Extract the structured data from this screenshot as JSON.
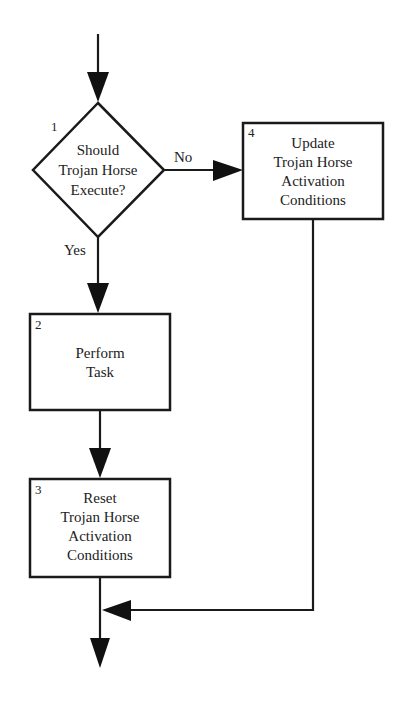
{
  "diagram": {
    "type": "flowchart",
    "colors": {
      "stroke": "#1a1a1a",
      "text": "#222222",
      "background": "#ffffff"
    },
    "nodes": [
      {
        "id": "1",
        "shape": "diamond",
        "number": "1",
        "lines": [
          "Should",
          "Trojan Horse",
          "Execute?"
        ]
      },
      {
        "id": "2",
        "shape": "rectangle",
        "number": "2",
        "lines": [
          "Perform",
          "Task"
        ]
      },
      {
        "id": "3",
        "shape": "rectangle",
        "number": "3",
        "lines": [
          "Reset",
          "Trojan Horse",
          "Activation",
          "Conditions"
        ]
      },
      {
        "id": "4",
        "shape": "rectangle",
        "number": "4",
        "lines": [
          "Update",
          "Trojan Horse",
          "Activation",
          "Conditions"
        ]
      }
    ],
    "edges": [
      {
        "from": "start",
        "to": "1",
        "label": ""
      },
      {
        "from": "1",
        "to": "4",
        "label": "No"
      },
      {
        "from": "1",
        "to": "2",
        "label": "Yes"
      },
      {
        "from": "2",
        "to": "3",
        "label": ""
      },
      {
        "from": "4",
        "to": "merge",
        "label": ""
      },
      {
        "from": "3",
        "to": "end",
        "label": ""
      }
    ],
    "labels": {
      "no": "No",
      "yes": "Yes"
    }
  }
}
